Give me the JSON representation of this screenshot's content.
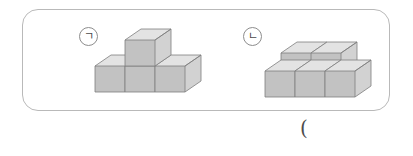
{
  "page": {
    "background_color": "#ffffff",
    "width": 413,
    "height": 156
  },
  "problem_box": {
    "border_color": "#b9b9b9",
    "corner_radius": "16px"
  },
  "figures": [
    {
      "label": "ㄱ",
      "label_name": "giyeok",
      "description": "Three cubes in a bottom row with one cube stacked on top of the middle cube",
      "cube_count": 4,
      "layers": [
        {
          "level": "bottom",
          "cubes": 3
        },
        {
          "level": "top",
          "cubes": 1
        }
      ]
    },
    {
      "label": "ㄴ",
      "label_name": "nieun",
      "description": "L-shaped arrangement: three cubes in the front row and two cubes in the back row",
      "cube_count": 5,
      "layers": [
        {
          "level": "front-row",
          "cubes": 3
        },
        {
          "level": "back-row",
          "cubes": 2
        }
      ]
    }
  ],
  "colors": {
    "cube_top_face": "#e3e3e3",
    "cube_left_face": "#c2c2c2",
    "cube_right_face": "#d2d2d2",
    "cube_edge": "#7e7e7e",
    "box_border": "#b9b9b9",
    "label_text": "#4a4a4a"
  },
  "annotations": {
    "trailing_paren": "("
  }
}
